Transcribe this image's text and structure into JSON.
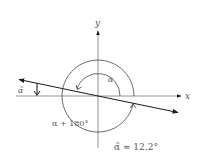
{
  "diagram": {
    "type": "angle-of-inclination",
    "axes": {
      "x_label": "x",
      "y_label": "y"
    },
    "labels": {
      "alpha": "α",
      "alpha_plus_180": "α + 180°",
      "alpha_tilde": "α̃",
      "alpha_tilde_value": "α̃ ≈ 12.2°"
    },
    "colors": {
      "line": "#1a1a1a",
      "axis": "#555555",
      "text": "#555555"
    }
  }
}
